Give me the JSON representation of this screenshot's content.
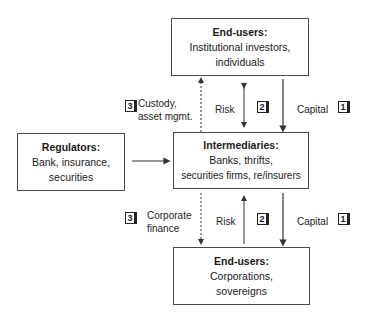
{
  "top_box": {
    "title": "End-users:",
    "lines": [
      "Institutional investors,",
      "individuals"
    ]
  },
  "middle_box": {
    "title": "Intermediaries:",
    "lines": [
      "Banks, thrifts,",
      "securities firms, re/insurers"
    ]
  },
  "bottom_box": {
    "title": "End-users:",
    "lines": [
      "Corporations,",
      "sovereigns"
    ]
  },
  "regulator_box": {
    "title": "Regulators:",
    "lines": [
      "Bank, insurance,",
      "securities"
    ]
  },
  "upper_flows": {
    "service": {
      "badge": "3",
      "lines": [
        "Custody,",
        "asset mgmt."
      ],
      "arrow": "dashed-up"
    },
    "risk": {
      "badge": "2",
      "label": "Risk",
      "arrow": "double"
    },
    "capital": {
      "badge": "1",
      "label": "Capital",
      "arrow": "down"
    }
  },
  "lower_flows": {
    "service": {
      "badge": "3",
      "lines": [
        "Corporate",
        "finance"
      ],
      "arrow": "dashed-down"
    },
    "risk": {
      "badge": "2",
      "label": "Risk",
      "arrow": "up"
    },
    "capital": {
      "badge": "1",
      "label": "Capital",
      "arrow": "down"
    }
  },
  "colors": {
    "line": "#333333",
    "box_border": "#4a4a4a",
    "text": "#1a1a1a"
  }
}
